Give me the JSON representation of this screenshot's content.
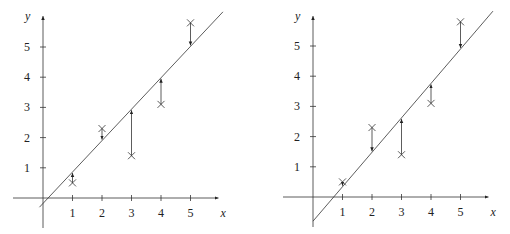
{
  "chart_data": [
    {
      "type": "scatter",
      "title": "",
      "xlabel": "x",
      "ylabel": "y",
      "x_ticks": [
        "1",
        "2",
        "3",
        "4",
        "5"
      ],
      "y_ticks": [
        "1",
        "2",
        "3",
        "4",
        "5"
      ],
      "points": [
        [
          1,
          0.5
        ],
        [
          2,
          2.3
        ],
        [
          3,
          1.4
        ],
        [
          4,
          3.1
        ],
        [
          5,
          5.8
        ]
      ],
      "fit_line": {
        "slope": 1.04,
        "intercept": -0.18
      },
      "residual_arrows_to_line": true,
      "grid": false
    },
    {
      "type": "scatter",
      "title": "",
      "xlabel": "x",
      "ylabel": "y",
      "x_ticks": [
        "1",
        "2",
        "3",
        "4",
        "5"
      ],
      "y_ticks": [
        "1",
        "2",
        "3",
        "4",
        "5"
      ],
      "points": [
        [
          1,
          0.5
        ],
        [
          2,
          2.3
        ],
        [
          3,
          1.4
        ],
        [
          4,
          3.1
        ],
        [
          5,
          5.8
        ]
      ],
      "fit_line": {
        "slope": 1.14,
        "intercept": -0.8
      },
      "residual_arrows_to_line": true,
      "grid": false
    }
  ],
  "labels": {
    "x": "x",
    "y": "y",
    "t1": "1",
    "t2": "2",
    "t3": "3",
    "t4": "4",
    "t5": "5"
  }
}
